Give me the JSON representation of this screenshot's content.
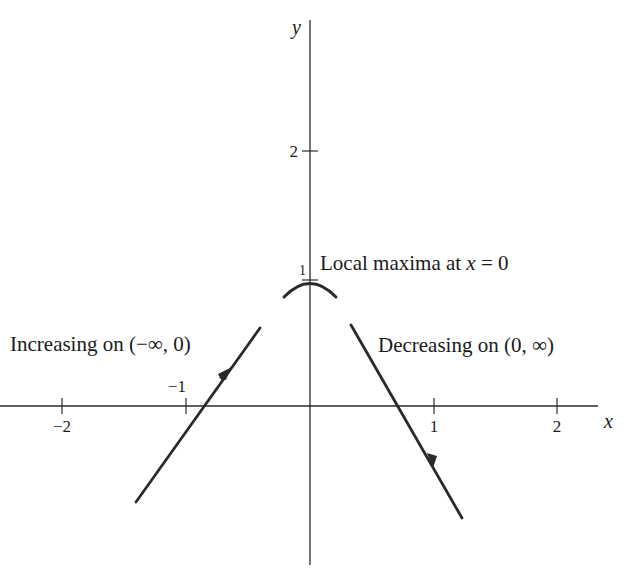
{
  "diagram": {
    "type": "function-behavior-sketch",
    "axes": {
      "x_label": "x",
      "y_label": "y",
      "x_ticks": [
        {
          "value": -2,
          "label": "−2"
        },
        {
          "value": -1,
          "label": "−1"
        },
        {
          "value": 1,
          "label": "1"
        },
        {
          "value": 2,
          "label": "2"
        }
      ],
      "y_ticks": [
        {
          "value": 1,
          "label": "1"
        },
        {
          "value": 2,
          "label": "2"
        }
      ]
    },
    "annotations": {
      "max_label": "Local maxima at ",
      "max_var": "x",
      "max_eq": " = 0",
      "increasing": "Increasing on (−∞, 0)",
      "decreasing": "Decreasing on (0, ∞)"
    },
    "colors": {
      "stroke": "#2a2a2a",
      "text": "#1a1a1a"
    }
  }
}
